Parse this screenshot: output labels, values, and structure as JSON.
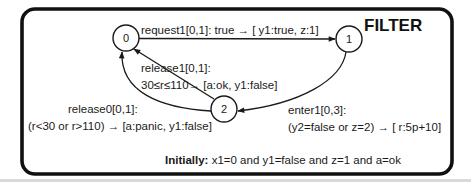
{
  "title": "FILTER",
  "colors": {
    "ink": "#1a1a1a",
    "frame": "#111111",
    "background": "#ffffff"
  },
  "states": [
    {
      "id": "0",
      "label": "0",
      "cx": 126,
      "cy": 38,
      "r": 13
    },
    {
      "id": "1",
      "label": "1",
      "cx": 349,
      "cy": 39,
      "r": 13
    },
    {
      "id": "2",
      "label": "2",
      "cx": 224,
      "cy": 109,
      "r": 13
    }
  ],
  "transitions": [
    {
      "from": "0",
      "to": "1",
      "event": "request1[0,1]",
      "label": "request1[0,1]: true  → [ y1:true,  z:1]"
    },
    {
      "from": "2",
      "to": "0",
      "event": "release1[0,1]",
      "label_line1": "release1[0,1]:",
      "label_line2": "30≤r≤110→ [a:ok,  y1:false]"
    },
    {
      "from": "2",
      "to": "0",
      "event": "release0[0,1]",
      "label_line1": "release0[0,1]:",
      "label_line2": "(r<30 or r>110) → [a:panic,  y1:false]"
    },
    {
      "from": "1",
      "to": "2",
      "event": "enter1[0,3]",
      "label_line1": "enter1[0,3]:",
      "label_line2": "(y2=false or z=2) → [ r:5p+10]"
    }
  ],
  "initial": {
    "prefix": "Initially:",
    "condition": " x1=0 and y1=false and z=1 and a=ok"
  }
}
